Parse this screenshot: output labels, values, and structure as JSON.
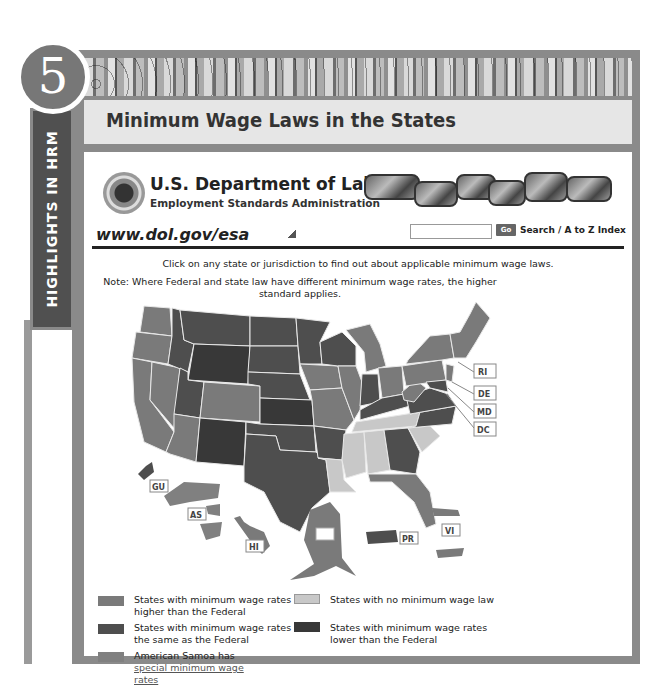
{
  "sidebar": {
    "label": "HIGHLIGHTS IN HRM"
  },
  "badge": {
    "number": "5"
  },
  "title": "Minimum Wage Laws in the States",
  "dol": {
    "name": "U.S. Department of Labor",
    "agency": "Employment Standards Administration",
    "url": "www.dol.gov/esa"
  },
  "search": {
    "placeholder": "",
    "go_label": "Go",
    "link_label": "Search / A to Z Index"
  },
  "instruction": "Click on any state or jurisdiction to find out about applicable minimum wage laws.",
  "note": "Note: Where Federal and state law have different minimum wage rates, the higher standard applies.",
  "colors": {
    "higher": "#7a7a7a",
    "same": "#4e4e4e",
    "none": "#c8c8c8",
    "lower": "#383838",
    "special": "#808080"
  },
  "map": {
    "jurisdiction_labels": [
      "RI",
      "DE",
      "MD",
      "DC",
      "GU",
      "AS",
      "HI",
      "AK",
      "PR",
      "VI"
    ]
  },
  "legend": [
    {
      "key": "higher",
      "text": "States with minimum wage rates higher than the Federal"
    },
    {
      "key": "none",
      "text": "States with no minimum wage law"
    },
    {
      "key": "same",
      "text": "States with minimum wage rates the same as the Federal"
    },
    {
      "key": "lower",
      "text": "States with minimum wage rates lower than the Federal"
    },
    {
      "key": "special",
      "text_prefix": "American Samoa has ",
      "link_text": "special minimum wage rates"
    }
  ]
}
